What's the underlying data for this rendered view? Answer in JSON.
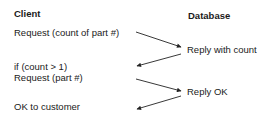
{
  "columns": {
    "client": "Client",
    "database": "Database"
  },
  "client_messages": [
    "Request (count of part #)",
    "if (count > 1)",
    "Request (part #)",
    "OK to customer"
  ],
  "database_messages": [
    "Reply with count",
    "Reply OK"
  ],
  "arrows": [
    {
      "from": "client",
      "to": "database",
      "label": "Request (count of part #) -> Reply with count"
    },
    {
      "from": "database",
      "to": "client",
      "label": "Reply with count -> if (count > 1)"
    },
    {
      "from": "client",
      "to": "database",
      "label": "Request (part #) -> Reply OK"
    },
    {
      "from": "database",
      "to": "client",
      "label": "Reply OK -> OK to customer"
    }
  ],
  "colors": {
    "text": "#1a1a1a",
    "line": "#222222",
    "background": "#ffffff"
  }
}
